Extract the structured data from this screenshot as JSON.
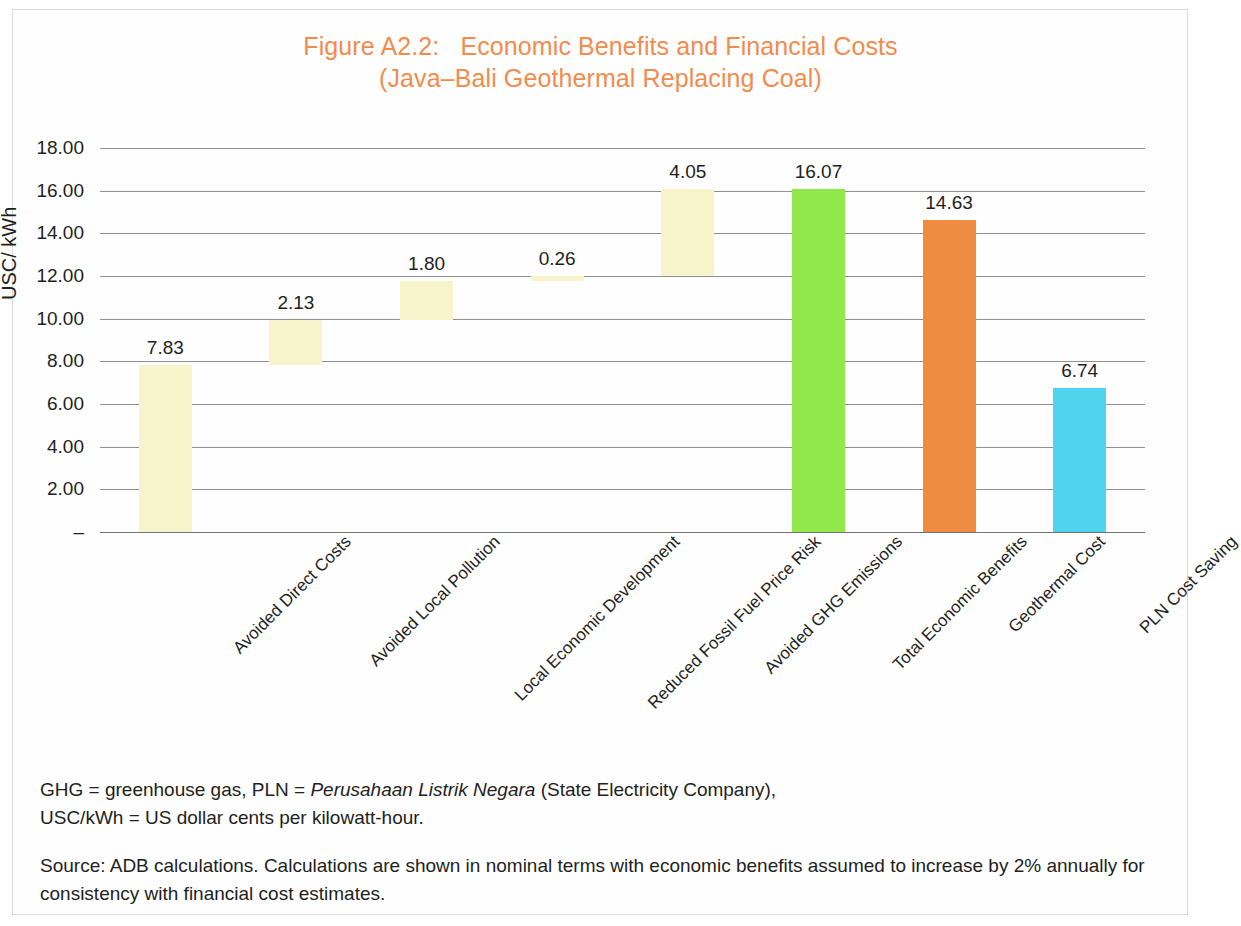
{
  "figure": {
    "title_line1": "Figure A2.2:   Economic Benefits and Financial Costs",
    "title_line2": "(Java–Bali Geothermal Replacing Coal)",
    "title_color": "#F08C4E"
  },
  "notes": {
    "abbrev_part1": "GHG = greenhouse gas, PLN = ",
    "abbrev_italic": "Perusahaan Listrik Negara",
    "abbrev_part2": " (State Electricity Company),",
    "abbrev_line2": "USC/kWh = US dollar cents per kilowatt-hour.",
    "source": "Source: ADB calculations. Calculations are shown in nominal terms with economic benefits assumed to increase by 2% annually for consistency with financial cost estimates."
  },
  "chart_data": {
    "type": "bar",
    "subtype": "waterfall",
    "title": "Figure A2.2:   Economic Benefits and Financial Costs (Java–Bali Geothermal Replacing Coal)",
    "xlabel": "",
    "ylabel": "USC/ kWh",
    "ylim": [
      0,
      18
    ],
    "ytick_labels": [
      "18.00",
      "16.00",
      "14.00",
      "12.00",
      "10.00",
      "8.00",
      "6.00",
      "4.00",
      "2.00",
      "–"
    ],
    "ytick_values": [
      18,
      16,
      14,
      12,
      10,
      8,
      6,
      4,
      2,
      0
    ],
    "grid": true,
    "legend": "none",
    "categories": [
      "Avoided Direct Costs",
      "Avoided Local Pollution",
      "Local Economic Development",
      "Reduced Fossil Fuel Price Risk",
      "Avoided GHG Emissions",
      "Total Economic Benefits",
      "Geothermal Cost",
      "PLN Cost Saving"
    ],
    "values": [
      7.83,
      2.13,
      1.8,
      0.26,
      4.05,
      16.07,
      14.63,
      6.74
    ],
    "value_labels": [
      "7.83",
      "2.13",
      "1.80",
      "0.26",
      "4.05",
      "16.07",
      "14.63",
      "6.74"
    ],
    "bar_base": [
      0,
      7.83,
      9.96,
      11.76,
      12.02,
      0,
      0,
      0
    ],
    "bar_top": [
      7.83,
      9.96,
      11.76,
      12.02,
      16.07,
      16.07,
      14.63,
      6.74
    ],
    "colors": [
      "#F7F4CC",
      "#F7F4CC",
      "#F7F4CC",
      "#F7F4CC",
      "#F7F4CC",
      "#90E84A",
      "#F08B42",
      "#4FD4EE"
    ],
    "bars": [
      {
        "label": "Avoided Direct Costs",
        "value": 7.83,
        "value_label": "7.83",
        "base": 0,
        "top": 7.83,
        "color": "#F7F4CC"
      },
      {
        "label": "Avoided Local Pollution",
        "value": 2.13,
        "value_label": "2.13",
        "base": 7.83,
        "top": 9.96,
        "color": "#F7F4CC"
      },
      {
        "label": "Local Economic Development",
        "value": 1.8,
        "value_label": "1.80",
        "base": 9.96,
        "top": 11.76,
        "color": "#F7F4CC"
      },
      {
        "label": "Reduced Fossil Fuel Price Risk",
        "value": 0.26,
        "value_label": "0.26",
        "base": 11.76,
        "top": 12.02,
        "color": "#F7F4CC"
      },
      {
        "label": "Avoided GHG Emissions",
        "value": 4.05,
        "value_label": "4.05",
        "base": 12.02,
        "top": 16.07,
        "color": "#F7F4CC"
      },
      {
        "label": "Total Economic Benefits",
        "value": 16.07,
        "value_label": "16.07",
        "base": 0,
        "top": 16.07,
        "color": "#90E84A"
      },
      {
        "label": "Geothermal Cost",
        "value": 14.63,
        "value_label": "14.63",
        "base": 0,
        "top": 14.63,
        "color": "#F08B42"
      },
      {
        "label": "PLN Cost Saving",
        "value": 6.74,
        "value_label": "6.74",
        "base": 0,
        "top": 6.74,
        "color": "#4FD4EE"
      }
    ]
  }
}
